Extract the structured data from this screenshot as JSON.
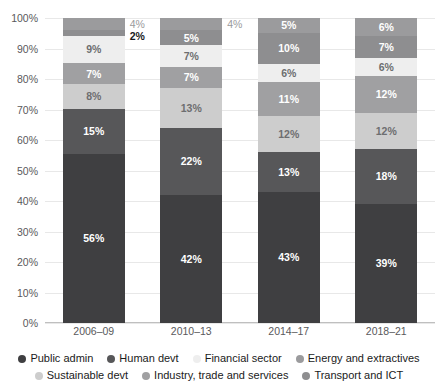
{
  "chart_data": {
    "type": "bar",
    "stacked": true,
    "stack_mode": "percent",
    "title": "",
    "subtitle": "",
    "xlabel": "",
    "ylabel": "",
    "categories": [
      "2006–09",
      "2010–13",
      "2014–17",
      "2018–21"
    ],
    "ylim": [
      0,
      100
    ],
    "ytick_labels": [
      "0%",
      "10%",
      "20%",
      "30%",
      "40%",
      "50%",
      "60%",
      "70%",
      "80%",
      "90%",
      "100%"
    ],
    "ytick_values": [
      0,
      10,
      20,
      30,
      40,
      50,
      60,
      70,
      80,
      90,
      100
    ],
    "grid": true,
    "legend_position": "bottom",
    "series": [
      {
        "name": "Public admin",
        "color": "#3f3f41",
        "label_color": "on-dark",
        "values": [
          56,
          42,
          43,
          39
        ],
        "labels": [
          "56%",
          "42%",
          "43%",
          "39%"
        ]
      },
      {
        "name": "Human devt",
        "color": "#575759",
        "label_color": "on-dark",
        "values": [
          15,
          22,
          13,
          18
        ],
        "labels": [
          "15%",
          "22%",
          "13%",
          "18%"
        ]
      },
      {
        "name": "Sustainable devt",
        "color": "#cdcdcd",
        "label_color": "on-light",
        "values": [
          8,
          13,
          12,
          12
        ],
        "labels": [
          "8%",
          "13%",
          "12%",
          "12%"
        ]
      },
      {
        "name": "Industry, trade and services",
        "color": "#a0a0a2",
        "label_color": "on-dark",
        "values": [
          7,
          7,
          11,
          12
        ],
        "labels": [
          "7%",
          "7%",
          "11%",
          "12%"
        ]
      },
      {
        "name": "Financial sector",
        "color": "#eeeeee",
        "label_color": "on-light",
        "values": [
          9,
          7,
          6,
          6
        ],
        "labels": [
          "9%",
          "7%",
          "6%",
          "6%"
        ]
      },
      {
        "name": "Transport and ICT",
        "color": "#8e8e90",
        "label_color": "on-dark",
        "values": [
          2,
          5,
          10,
          7
        ],
        "labels": [
          "2%",
          "5%",
          "10%",
          "7%"
        ]
      },
      {
        "name": "Energy and extractives",
        "color": "#9b9b9d",
        "label_color": "on-dark",
        "values": [
          4,
          4,
          5,
          6
        ],
        "labels": [
          "4%",
          "4%",
          "5%",
          "6%"
        ]
      }
    ],
    "outside_labels": [
      {
        "bar": 0,
        "text": "4%",
        "style": "muted",
        "at_percent": 98
      },
      {
        "bar": 0,
        "text": "2%",
        "style": "strong",
        "at_percent": 94
      },
      {
        "bar": 1,
        "text": "4%",
        "style": "muted",
        "at_percent": 98
      }
    ],
    "annotations": []
  },
  "legend": {
    "rows": [
      [
        "Public admin",
        "Human devt",
        "Financial sector",
        "Energy and extractives"
      ],
      [
        "Sustainable devt",
        "Industry, trade and services",
        "Transport and ICT"
      ]
    ]
  }
}
